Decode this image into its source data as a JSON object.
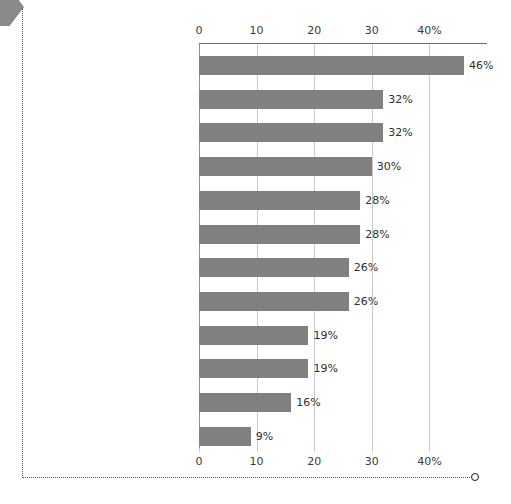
{
  "decor": {
    "corner_arrow_icon": "arrow-right-icon",
    "frame_endpoint_icon": "circle-endpoint-icon",
    "frame_color": "#555555",
    "arrow_color": "#8a8a8a"
  },
  "chart_data": {
    "type": "bar",
    "orientation": "horizontal",
    "title": "",
    "subtitle": "",
    "xlabel": "",
    "ylabel": "",
    "xlim": [
      0,
      50
    ],
    "xticks": [
      0,
      10,
      20,
      30,
      40
    ],
    "xtick_labels": [
      "0",
      "10",
      "20",
      "30",
      "40%"
    ],
    "axis_positions": [
      "top",
      "bottom"
    ],
    "grid": true,
    "grid_axis": "x",
    "legend": false,
    "bar_color": "#808080",
    "value_suffix": "%",
    "categories": [
      "Women's rights",
      "The environment and energy issues",
      "In opposition to Donald Trump",
      "Immigration",
      "LGBT issues",
      "Affordable Care Act/Obamacare",
      "Abortion or birth control",
      "Police conduct",
      "Gun rights or restrictions",
      "In support of Donald Trump",
      "Minimum wage",
      "Removing Confederate monuments"
    ],
    "values": [
      46,
      32,
      32,
      30,
      28,
      28,
      26,
      26,
      19,
      19,
      16,
      9
    ],
    "value_labels": [
      "46%",
      "32%",
      "32%",
      "30%",
      "28%",
      "28%",
      "26%",
      "26%",
      "19%",
      "19%",
      "16%",
      "9%"
    ]
  }
}
